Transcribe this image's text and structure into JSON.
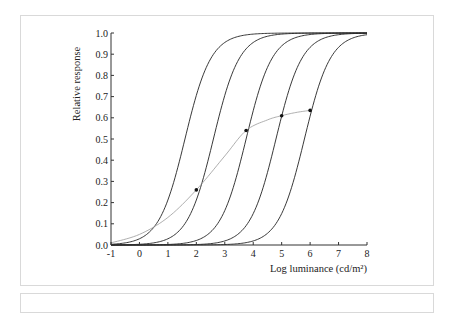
{
  "chart_data": {
    "type": "line",
    "title": "",
    "xlabel": "Log luminance (cd/m²)",
    "ylabel": "Relative response",
    "xlim": [
      -1,
      8
    ],
    "ylim": [
      0.0,
      1.0
    ],
    "xticks": [
      "-1",
      "0",
      "1",
      "2",
      "3",
      "4",
      "5",
      "6",
      "7",
      "8"
    ],
    "yticks": [
      "0.0",
      "0.1",
      "0.2",
      "0.3",
      "0.4",
      "0.5",
      "0.6",
      "0.7",
      "0.8",
      "0.9",
      "1.0"
    ],
    "grid": false,
    "legend": null,
    "series": [
      {
        "name": "Response curve 1",
        "color": "#222222",
        "half_saturation_log_L": 1.6,
        "slope": 0.95
      },
      {
        "name": "Response curve 2",
        "color": "#222222",
        "half_saturation_log_L": 2.6,
        "slope": 0.95
      },
      {
        "name": "Response curve 3",
        "color": "#222222",
        "half_saturation_log_L": 3.75,
        "slope": 0.95
      },
      {
        "name": "Response curve 4",
        "color": "#222222",
        "half_saturation_log_L": 4.8,
        "slope": 0.95
      },
      {
        "name": "Response curve 5",
        "color": "#222222",
        "half_saturation_log_L": 5.8,
        "slope": 0.95
      },
      {
        "name": "Operating point curve",
        "color": "#9a9a9a",
        "x": [
          -1,
          0,
          1,
          2,
          3,
          3.75,
          4.5,
          5,
          5.5,
          6
        ],
        "y": [
          0.01,
          0.05,
          0.13,
          0.26,
          0.42,
          0.54,
          0.59,
          0.61,
          0.625,
          0.635
        ]
      }
    ],
    "markers": [
      {
        "x": 2.0,
        "y": 0.26
      },
      {
        "x": 3.75,
        "y": 0.54
      },
      {
        "x": 5.0,
        "y": 0.61
      },
      {
        "x": 6.0,
        "y": 0.635
      }
    ]
  }
}
